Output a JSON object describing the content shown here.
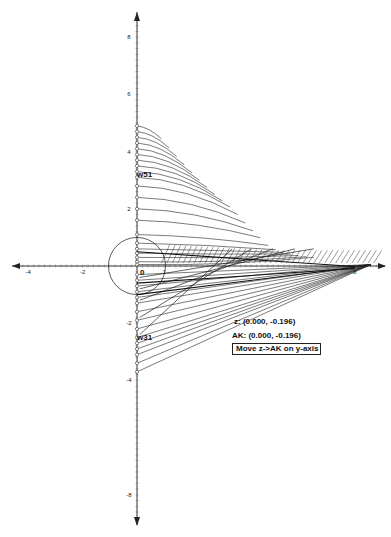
{
  "graph": {
    "origin_px": [
      137,
      266
    ],
    "unit_x_px": 27.2,
    "unit_y_px": 28.6,
    "x_axis": {
      "range": [
        -4.4,
        9
      ],
      "tick_labels": [
        "-4",
        "-2",
        "0",
        "1",
        "8"
      ],
      "arrow_left": true,
      "arrow_right": true
    },
    "y_axis": {
      "range": [
        -9,
        9
      ],
      "tick_labels": [
        "8",
        "6",
        "4",
        "2",
        "-2",
        "-4",
        "-8"
      ],
      "arrow_up": true,
      "arrow_down": true
    },
    "unit_circle": {
      "center": [
        0,
        0
      ],
      "radius": 1
    },
    "line_color": "#222222",
    "axis_color": "#333333"
  },
  "labels": {
    "w51": "w51",
    "w31": "w31",
    "origin": "0",
    "one": "1"
  },
  "readouts": {
    "z": "z: (0.000, -0.196)",
    "ak": "AK: (0.000, -0.196)"
  },
  "controls": {
    "move_button": "Move z->AK on y-axis"
  },
  "footer": {
    "partial_text": "· · · ·"
  }
}
